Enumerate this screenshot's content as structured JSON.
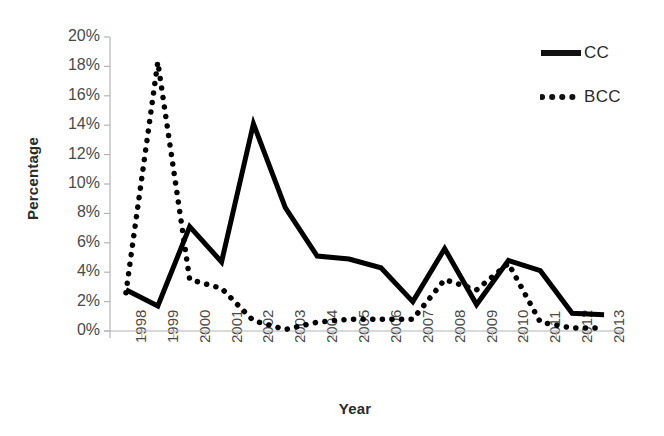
{
  "chart_data": {
    "type": "line",
    "title": "",
    "xlabel": "Year",
    "ylabel": "Percentage",
    "categories": [
      "1998",
      "1999",
      "2000",
      "2001",
      "2002",
      "2003",
      "2004",
      "2005",
      "2006",
      "2007",
      "2008",
      "2009",
      "2010",
      "2011",
      "2012",
      "2013"
    ],
    "series": [
      {
        "name": "CC",
        "style": "solid",
        "color": "#000000",
        "values": [
          2.8,
          1.7,
          7.1,
          4.7,
          14.1,
          8.4,
          5.1,
          4.9,
          4.3,
          2.0,
          5.6,
          1.8,
          4.8,
          4.1,
          1.2,
          1.1
        ]
      },
      {
        "name": "BCC",
        "style": "dotted",
        "color": "#000000",
        "values": [
          2.6,
          18.3,
          3.5,
          2.9,
          0.7,
          0.1,
          0.6,
          0.8,
          0.8,
          0.8,
          3.5,
          2.8,
          4.6,
          0.6,
          0.2,
          0.2
        ]
      }
    ],
    "ylim": [
      0,
      20
    ],
    "y_tick_step": 2,
    "y_tick_labels": [
      "20%",
      "18%",
      "16%",
      "14%",
      "12%",
      "10%",
      "8%",
      "6%",
      "4%",
      "2%",
      "0%"
    ],
    "grid": false,
    "legend_position": "top-right"
  },
  "legend": {
    "entries": [
      {
        "label": "CC",
        "style": "solid"
      },
      {
        "label": "BCC",
        "style": "dotted"
      }
    ]
  },
  "axes": {
    "y_title": "Percentage",
    "x_title": "Year"
  }
}
